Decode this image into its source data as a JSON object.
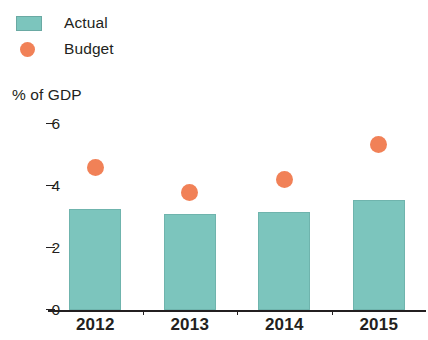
{
  "legend": {
    "items": [
      {
        "label": "Actual",
        "marker": "rect",
        "color": "#7cc5bd"
      },
      {
        "label": "Budget",
        "marker": "circle",
        "color": "#f18157"
      }
    ]
  },
  "chart_data": {
    "type": "bar",
    "title": "",
    "subtitle": "",
    "xlabel": "",
    "ylabel": "% of GDP",
    "categories": [
      "2012",
      "2013",
      "2014",
      "2015"
    ],
    "ylim": [
      0,
      6
    ],
    "yticks": [
      0,
      2,
      4,
      6
    ],
    "ytick_labels": [
      "0",
      "2",
      "4",
      "6"
    ],
    "grid": false,
    "legend_position": "top-left",
    "series": [
      {
        "name": "Actual",
        "type": "bar",
        "color": "#7cc5bd",
        "values": [
          3.25,
          3.1,
          3.15,
          3.55
        ]
      },
      {
        "name": "Budget",
        "type": "scatter",
        "color": "#f18157",
        "values": [
          4.6,
          3.8,
          4.2,
          5.35
        ]
      }
    ]
  }
}
